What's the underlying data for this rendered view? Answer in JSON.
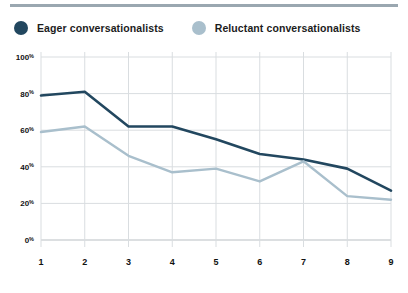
{
  "legend": {
    "items": [
      {
        "label": "Eager conversationalists",
        "color": "#22475f",
        "icon": "legend-dot-icon"
      },
      {
        "label": "Reluctant conversationalists",
        "color": "#a9bfcc",
        "icon": "legend-dot-icon"
      }
    ]
  },
  "axis": {
    "y_ticks": [
      "100",
      "80",
      "60",
      "40",
      "20",
      "0"
    ],
    "y_suffix": "%",
    "x_ticks": [
      "1",
      "2",
      "3",
      "4",
      "5",
      "6",
      "7",
      "8",
      "9"
    ]
  },
  "chart_data": {
    "type": "line",
    "title": "",
    "subtitle": "",
    "xlabel": "",
    "ylabel": "",
    "x": [
      1,
      2,
      3,
      4,
      5,
      6,
      7,
      8,
      9
    ],
    "categories": [
      "1",
      "2",
      "3",
      "4",
      "5",
      "6",
      "7",
      "8",
      "9"
    ],
    "ylim": [
      0,
      100
    ],
    "yticks": [
      0,
      20,
      40,
      60,
      80,
      100
    ],
    "ytick_labels": [
      "0%",
      "20%",
      "40%",
      "60%",
      "80%",
      "100%"
    ],
    "grid": true,
    "grid_color": "#d9dde0",
    "legend_position": "top-left",
    "series": [
      {
        "name": "Eager conversationalists",
        "color": "#22475f",
        "values": [
          79,
          81,
          62,
          62,
          55,
          47,
          44,
          39,
          27
        ]
      },
      {
        "name": "Reluctant conversationalists",
        "color": "#a9bfcc",
        "values": [
          59,
          62,
          46,
          37,
          39,
          32,
          43,
          24,
          22
        ]
      }
    ]
  }
}
